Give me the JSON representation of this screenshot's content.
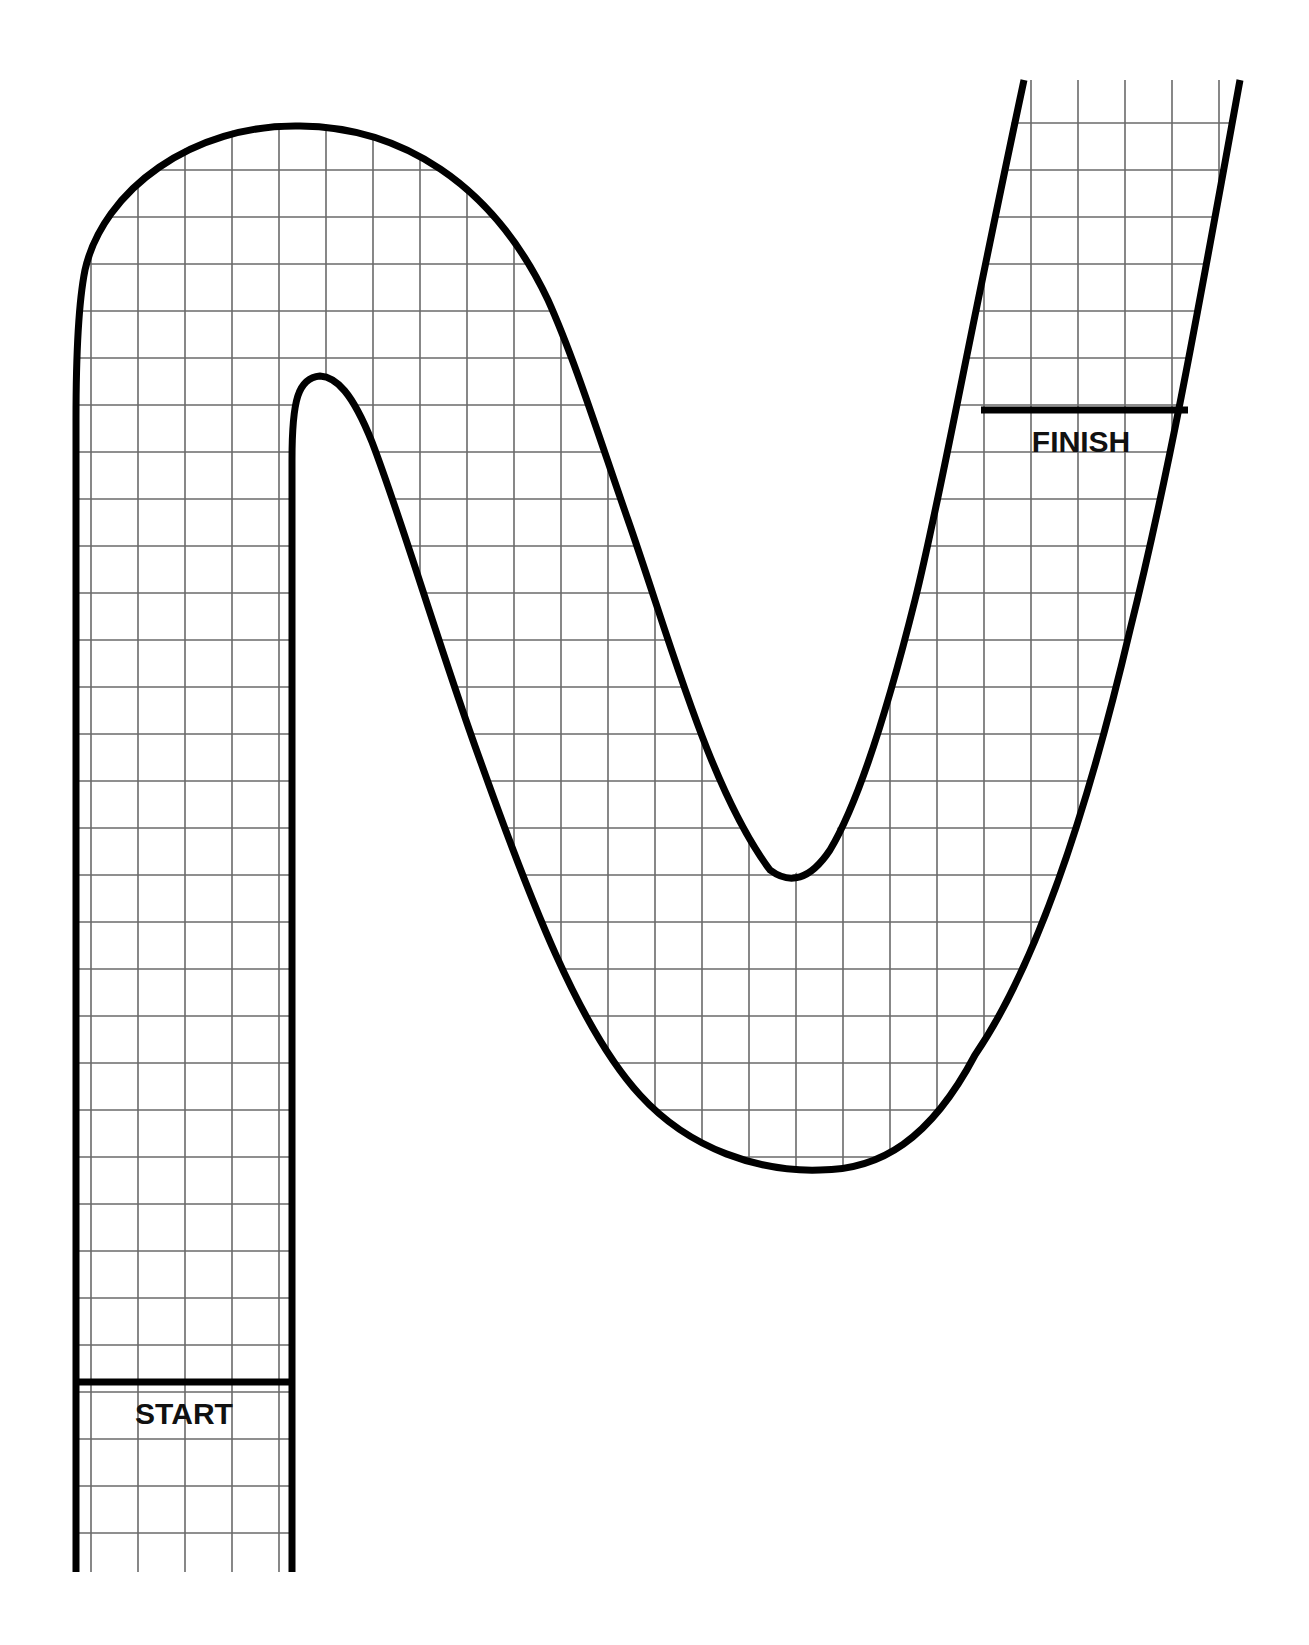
{
  "diagram": {
    "type": "race-track-board",
    "labels": {
      "start": "START",
      "finish": "FINISH"
    },
    "colors": {
      "outline": "#000000",
      "grid": "#6a6a6a",
      "background": "#ffffff",
      "text": "#111111"
    },
    "grid": {
      "cell_size_px": 47
    }
  }
}
